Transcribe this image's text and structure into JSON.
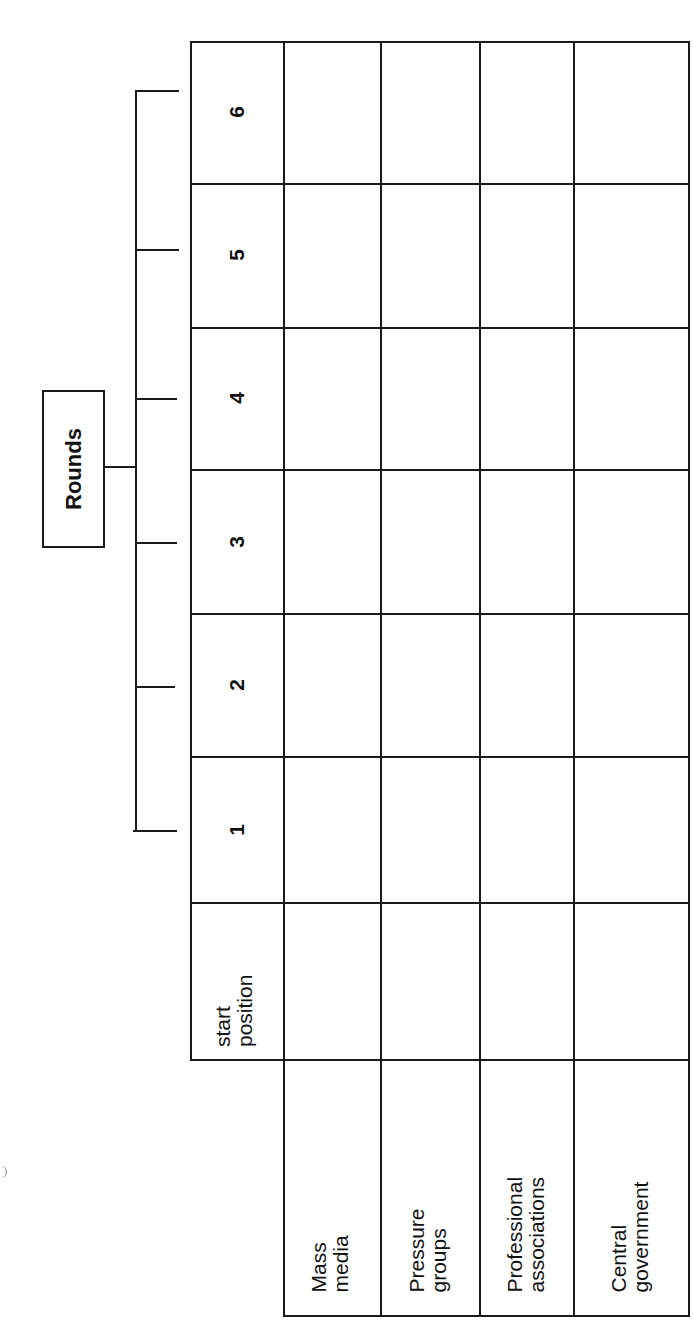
{
  "header": {
    "group_label": "Rounds"
  },
  "table": {
    "column_headers": {
      "start": "start\nposition",
      "rounds": [
        "1",
        "2",
        "3",
        "4",
        "5",
        "6"
      ]
    },
    "rows": [
      {
        "label": "Mass\nmedia",
        "cells": [
          "",
          "",
          "",
          "",
          "",
          "",
          ""
        ]
      },
      {
        "label": "Pressure\ngroups",
        "cells": [
          "",
          "",
          "",
          "",
          "",
          "",
          ""
        ]
      },
      {
        "label": "Professional\nassociations",
        "cells": [
          "",
          "",
          "",
          "",
          "",
          "",
          ""
        ]
      },
      {
        "label": "Central\ngovernment",
        "cells": [
          "",
          "",
          "",
          "",
          "",
          "",
          ""
        ]
      }
    ]
  },
  "layout": {
    "orientation": "rotated-90-ccw"
  },
  "colors": {
    "ink": "#1a1a1a",
    "paper": "#ffffff"
  }
}
